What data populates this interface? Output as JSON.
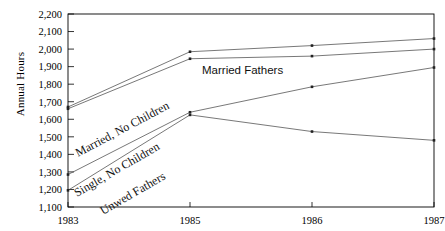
{
  "chart_data": {
    "type": "line",
    "title": "",
    "xlabel": "",
    "ylabel": "Annual Hours",
    "categories": [
      "1983",
      "1985",
      "1986",
      "1987"
    ],
    "ylim": [
      1100,
      2200
    ],
    "ytick_labels": [
      "2,200",
      "2,100",
      "2,000",
      "1,900",
      "1,800",
      "1,700",
      "1,600",
      "1,500",
      "1,400",
      "1,300",
      "1,200",
      "1,100"
    ],
    "ytick_values": [
      2200,
      2100,
      2000,
      1900,
      1800,
      1700,
      1600,
      1500,
      1400,
      1300,
      1200,
      1100
    ],
    "grid": false,
    "legend_position": "inline-annotations",
    "series": [
      {
        "name": "Married, No Children",
        "values": [
          1670,
          1985,
          2020,
          2060
        ],
        "label_text": "Married, No Children"
      },
      {
        "name": "Married Fathers",
        "values": [
          1660,
          1945,
          1960,
          2000
        ],
        "label_text": "Married Fathers"
      },
      {
        "name": "Single, No Children",
        "values": [
          1285,
          1640,
          1785,
          1895
        ],
        "label_text": "Single, No Children"
      },
      {
        "name": "Unwed Fathers",
        "values": [
          1195,
          1625,
          1530,
          1480
        ],
        "label_text": "Unwed Fathers"
      }
    ],
    "annotations": [
      {
        "id": "married-no-children",
        "text": "Married, No Children"
      },
      {
        "id": "married-fathers",
        "text": "Married Fathers"
      },
      {
        "id": "single-no-children",
        "text": "Single, No Children"
      },
      {
        "id": "unwed-fathers",
        "text": "Unwed Fathers"
      }
    ]
  },
  "axis": {
    "y_title": "Annual Hours",
    "y_ticks": [
      "2,200",
      "2,100",
      "2,000",
      "1,900",
      "1,800",
      "1,700",
      "1,600",
      "1,500",
      "1,400",
      "1,300",
      "1,200",
      "1,100"
    ],
    "x_ticks": [
      "1983",
      "1985",
      "1986",
      "1987"
    ]
  },
  "colors": {
    "line": "#555555",
    "marker": "#222222",
    "axis": "#000000",
    "background": "#ffffff",
    "text": "#000000"
  }
}
